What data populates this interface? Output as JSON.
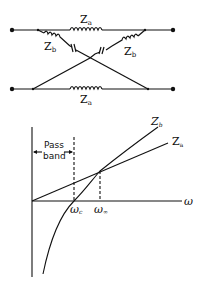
{
  "circuit": {
    "series_top_label": "Z",
    "series_top_sub": "a",
    "series_bottom_label": "Z",
    "series_bottom_sub": "a",
    "cross_left_label": "Z",
    "cross_left_sub": "b",
    "cross_right_label": "Z",
    "cross_right_sub": "b"
  },
  "graph": {
    "x_axis_label": "ω",
    "cutoff_label": "ω",
    "cutoff_sub": "c",
    "infinity_label": "ω",
    "infinity_sub": "∞",
    "curve_zb_label": "Z",
    "curve_zb_sub": "b",
    "line_za_label": "Z",
    "line_za_sub": "a",
    "passband_line1": "Pass",
    "passband_line2": "band"
  }
}
